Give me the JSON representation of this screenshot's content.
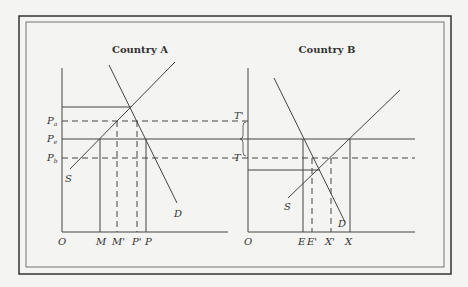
{
  "panels": [
    {
      "title": "Country A",
      "origin_label": "O",
      "curves": {
        "supply": "S",
        "demand": "D"
      },
      "price_labels": [
        {
          "main": "P",
          "sub": "a"
        },
        {
          "main": "P",
          "sub": "e"
        },
        {
          "main": "P",
          "sub": "b"
        }
      ],
      "quantity_labels": [
        "M",
        "M'",
        "P'",
        "P"
      ]
    },
    {
      "title": "Country B",
      "origin_label": "O",
      "curves": {
        "supply": "S",
        "demand": "D"
      },
      "price_labels": [
        "T'",
        "T"
      ],
      "quantity_labels": [
        "E",
        "E'",
        "X'",
        "X"
      ]
    }
  ],
  "colors": {
    "line": "#444444",
    "background": "#f4f4f2",
    "frame": "#333333"
  }
}
